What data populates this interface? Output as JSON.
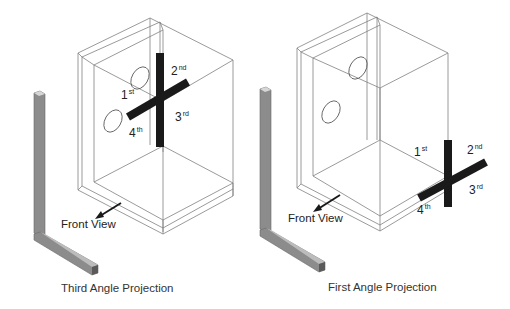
{
  "panels": [
    {
      "id": "third-angle",
      "caption": "Third Angle Projection",
      "front_view_label": "Front View",
      "ordinals": [
        {
          "num": "1",
          "suffix": "st"
        },
        {
          "num": "2",
          "suffix": "nd"
        },
        {
          "num": "3",
          "suffix": "rd"
        },
        {
          "num": "4",
          "suffix": "th"
        }
      ]
    },
    {
      "id": "first-angle",
      "caption": "First Angle Projection",
      "front_view_label": "Front View",
      "ordinals": [
        {
          "num": "1",
          "suffix": "st"
        },
        {
          "num": "2",
          "suffix": "nd"
        },
        {
          "num": "3",
          "suffix": "rd"
        },
        {
          "num": "4",
          "suffix": "th"
        }
      ]
    }
  ],
  "colors": {
    "line": "#7a7a7a",
    "bar": "#1a1a1a",
    "angle_fill": "#8c8c8c",
    "angle_dark": "#6a6a6a",
    "text": "#222222"
  }
}
